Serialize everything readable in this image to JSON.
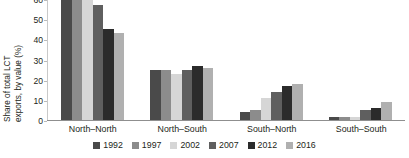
{
  "chart_data": {
    "type": "bar",
    "title": "",
    "xlabel": "",
    "ylabel": "Share of total LCT exports, by value (%)",
    "ylabel_line1": "Share of total LCT",
    "ylabel_line2": "exports, by value (%)",
    "ylim": [
      0,
      60
    ],
    "yticks": [
      0,
      10,
      20,
      30,
      40,
      50,
      60
    ],
    "ytick_labels": [
      "0",
      "10",
      "20",
      "30",
      "40",
      "50",
      "60"
    ],
    "grid": false,
    "legend_position": "bottom",
    "categories": [
      "North–North",
      "North–South",
      "South–North",
      "South–South"
    ],
    "series": [
      {
        "name": "1992",
        "color": "#4a4a4a",
        "values": [
          62,
          25,
          4,
          1.5
        ]
      },
      {
        "name": "1997",
        "color": "#8c8c8c",
        "values": [
          62,
          25,
          5,
          1.5
        ]
      },
      {
        "name": "2002",
        "color": "#d6d6d6",
        "values": [
          62,
          23,
          11,
          1.5
        ]
      },
      {
        "name": "2007",
        "color": "#5f5f5f",
        "values": [
          57,
          25,
          14,
          5
        ]
      },
      {
        "name": "2012",
        "color": "#2b2b2b",
        "values": [
          45,
          27,
          17,
          6
        ]
      },
      {
        "name": "2016",
        "color": "#b0b0b0",
        "values": [
          43,
          26,
          18,
          9
        ]
      }
    ]
  }
}
